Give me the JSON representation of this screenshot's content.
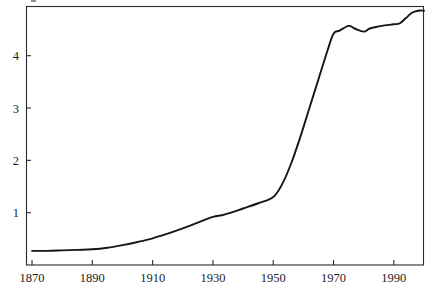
{
  "chart_data": {
    "type": "line",
    "title": "",
    "subtitle": "",
    "xlabel": "",
    "ylabel": "",
    "xlim": [
      1868,
      2000
    ],
    "ylim": [
      0,
      4.95
    ],
    "grid": false,
    "legend": null,
    "xticks": [
      1870,
      1890,
      1910,
      1930,
      1950,
      1970,
      1990
    ],
    "xtick_labels": [
      "1870",
      "1890",
      "1910",
      "1930",
      "1950",
      "1970",
      "1990"
    ],
    "yticks": [
      1,
      2,
      3,
      4
    ],
    "ytick_labels": [
      "1",
      "2",
      "3",
      "4"
    ],
    "tick_direction": "in",
    "line_color": "#161616",
    "frame_color": "#2b2b2b",
    "background_color": "#ffffff",
    "series": [
      {
        "name": "series-1",
        "x": [
          1870,
          1875,
          1880,
          1885,
          1890,
          1895,
          1900,
          1905,
          1910,
          1915,
          1920,
          1925,
          1930,
          1933,
          1936,
          1940,
          1945,
          1950,
          1953,
          1956,
          1959,
          1962,
          1965,
          1968,
          1970,
          1972,
          1975,
          1977,
          1980,
          1982,
          1985,
          1987,
          1990,
          1992,
          1994,
          1996,
          1998,
          2000
        ],
        "y": [
          0.27,
          0.27,
          0.28,
          0.29,
          0.3,
          0.33,
          0.38,
          0.44,
          0.51,
          0.6,
          0.7,
          0.81,
          0.92,
          0.95,
          1.0,
          1.08,
          1.18,
          1.3,
          1.55,
          1.95,
          2.45,
          3.0,
          3.55,
          4.1,
          4.42,
          4.48,
          4.57,
          4.52,
          4.46,
          4.52,
          4.56,
          4.58,
          4.6,
          4.62,
          4.72,
          4.82,
          4.86,
          4.86
        ]
      }
    ]
  },
  "axes": {
    "plot_left_px": 26,
    "plot_right_px": 424,
    "plot_top_px": 6,
    "plot_bottom_px": 265
  },
  "artifact": {
    "description": "cropped-glyph-fragment"
  }
}
